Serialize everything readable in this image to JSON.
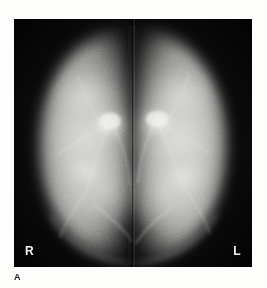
{
  "figure": {
    "caption_label": "A",
    "modality": "mammogram",
    "view": "bilateral craniocaudal",
    "plate": {
      "background_color": "#0a0a0a",
      "tissue_color": "#c9c9c9",
      "highlight_color": "#f0f0ee",
      "x": 14,
      "y": 19,
      "width": 238,
      "height": 248
    },
    "markers": [
      {
        "name": "right-breast-marker",
        "label": "R",
        "position": "bottom-left"
      },
      {
        "name": "left-breast-marker",
        "label": "L",
        "position": "bottom-right"
      }
    ],
    "divider": {
      "name": "midline-divider",
      "x": 133,
      "description": "vertical separation between right and left breast images"
    }
  }
}
